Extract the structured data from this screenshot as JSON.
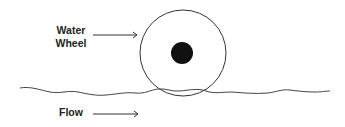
{
  "diagram": {
    "labels": {
      "wheel_line1": "Water",
      "wheel_line2": "Wheel",
      "flow": "Flow"
    },
    "colors": {
      "stroke": "#333333",
      "hub": "#111111",
      "background": "#ffffff"
    }
  }
}
